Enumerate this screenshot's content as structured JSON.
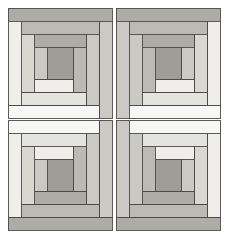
{
  "artwork": {
    "title": "Log Cabin Quilt Block",
    "pattern_name": "log-cabin-four-block",
    "arrangement": "2x2",
    "background": "#ffffff",
    "stroke_color": "#4a4a4a",
    "stroke_width": 0.9,
    "canvas": {
      "width": 228,
      "height": 238
    }
  },
  "palette": {
    "white": "#f7f7f5",
    "offwhite": "#efeeea",
    "light": "#e4e3de",
    "light_mid": "#d8d7d1",
    "mid": "#cac9c3",
    "mid_dark": "#bbbab4",
    "dark": "#adaca6",
    "darkest": "#9e9d98",
    "sash": "#f4f3ef"
  },
  "blocks": [
    {
      "id": "block-top-left",
      "row": 0,
      "col": 0,
      "orientation": "base",
      "x": 8,
      "y": 8,
      "w": 104,
      "h": 110
    },
    {
      "id": "block-top-right",
      "row": 0,
      "col": 1,
      "orientation": "mirror-x",
      "x": 116,
      "y": 8,
      "w": 104,
      "h": 110
    },
    {
      "id": "block-bottom-left",
      "row": 1,
      "col": 0,
      "orientation": "mirror-y",
      "x": 8,
      "y": 120,
      "w": 104,
      "h": 110
    },
    {
      "id": "block-bottom-right",
      "row": 1,
      "col": 1,
      "orientation": "mirror-xy",
      "x": 116,
      "y": 120,
      "w": 104,
      "h": 110
    }
  ],
  "log_sequence": [
    {
      "step": 0,
      "name": "center-square",
      "side": "center",
      "tone": "darkest",
      "thickness": 0
    },
    {
      "step": 1,
      "name": "log-1-left",
      "side": "left",
      "tone": "mid",
      "thickness": 13
    },
    {
      "step": 2,
      "name": "log-2-bottom",
      "side": "bottom",
      "tone": "offwhite",
      "thickness": 13
    },
    {
      "step": 3,
      "name": "log-3-right",
      "side": "right",
      "tone": "mid_dark",
      "thickness": 13
    },
    {
      "step": 4,
      "name": "log-4-top",
      "side": "top",
      "tone": "dark",
      "thickness": 13
    },
    {
      "step": 5,
      "name": "log-5-left",
      "side": "left",
      "tone": "light_mid",
      "thickness": 13
    },
    {
      "step": 6,
      "name": "log-6-bottom",
      "side": "bottom",
      "tone": "light",
      "thickness": 13
    },
    {
      "step": 7,
      "name": "log-7-right",
      "side": "right",
      "tone": "mid",
      "thickness": 13
    },
    {
      "step": 8,
      "name": "log-8-top",
      "side": "top",
      "tone": "mid_dark",
      "thickness": 13
    },
    {
      "step": 9,
      "name": "log-9-left",
      "side": "left",
      "tone": "offwhite",
      "thickness": 13
    },
    {
      "step": 10,
      "name": "log-10-bottom",
      "side": "bottom",
      "tone": "white",
      "thickness": 13
    },
    {
      "step": 11,
      "name": "log-11-right",
      "side": "right",
      "tone": "mid",
      "thickness": 13
    },
    {
      "step": 12,
      "name": "log-12-top",
      "side": "top",
      "tone": "dark",
      "thickness": 13
    }
  ],
  "center_square": {
    "name": "center-square",
    "tone": "darkest",
    "size": 26
  }
}
